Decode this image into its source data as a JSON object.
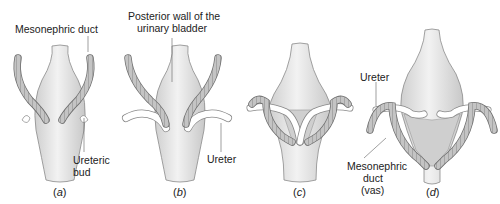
{
  "figure": {
    "panels": [
      {
        "id": "a",
        "caption_open": "(",
        "caption_letter": "a",
        "caption_close": ")"
      },
      {
        "id": "b",
        "caption_open": "(",
        "caption_letter": "b",
        "caption_close": ")"
      },
      {
        "id": "c",
        "caption_open": "(",
        "caption_letter": "c",
        "caption_close": ")"
      },
      {
        "id": "d",
        "caption_open": "(",
        "caption_letter": "d",
        "caption_close": ")"
      }
    ],
    "labels": {
      "mesonephric_duct_a": "Mesonephric duct",
      "ureteric_bud_1": "Ureteric",
      "ureteric_bud_2": "bud",
      "posterior_wall_1": "Posterior wall of the",
      "posterior_wall_2": "urinary bladder",
      "ureter_b": "Ureter",
      "ureter_d": "Ureter",
      "mesonephric_d_1": "Mesonephric",
      "mesonephric_d_2": "duct",
      "mesonephric_d_3": "(vas)"
    },
    "colors": {
      "bladder_fill": "#e6e6e6",
      "bladder_stroke": "#8a8a8a",
      "trigone_fill": "#cfcfcf",
      "duct_fill": "#bdbdbd",
      "duct_stroke": "#6e6e6e",
      "ureter_fill": "#ffffff",
      "leader_line": "#777777"
    }
  }
}
